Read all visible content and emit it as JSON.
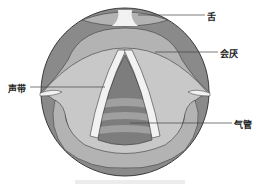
{
  "diagram": {
    "type": "anatomical-illustration",
    "labels": [
      {
        "id": "tongue",
        "text": "舌"
      },
      {
        "id": "epiglottis",
        "text": "会厌"
      },
      {
        "id": "vocal-cords",
        "text": "声带"
      },
      {
        "id": "trachea",
        "text": "气管"
      }
    ],
    "caption": ""
  },
  "colors": {
    "outer_ring": "#8a8a8a",
    "mid_tissue": "#b3b3b3",
    "inner_light": "#c8c8c8",
    "vocal_cord": "#f2f2f2",
    "trachea_dark": "#7d7d7d",
    "trachea_band": "#a0a0a0",
    "outline": "#3a3a3a"
  }
}
